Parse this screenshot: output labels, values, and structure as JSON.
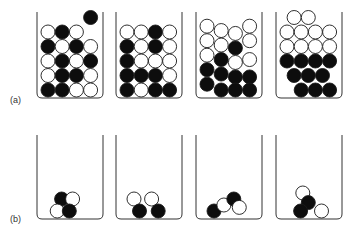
{
  "colors": {
    "stroke": "#1a1a1a",
    "black_ball": "#0d0d0d",
    "white_ball": "#ffffff",
    "beaker": "#333333"
  },
  "panels": [
    {
      "label": "(a)",
      "description": "Beakers filled with black and white balls, progressively separating",
      "beakers": [
        {
          "balls": [
            [
              "w",
              0,
              0
            ],
            [
              "b",
              1,
              0
            ],
            [
              "w",
              2,
              0
            ],
            [
              "b",
              3,
              -1
            ],
            [
              "b",
              0,
              1
            ],
            [
              "w",
              1,
              1
            ],
            [
              "b",
              2,
              1
            ],
            [
              "w",
              3,
              1
            ],
            [
              "w",
              0,
              2
            ],
            [
              "b",
              1,
              2
            ],
            [
              "w",
              2,
              2
            ],
            [
              "b",
              3,
              2
            ],
            [
              "w",
              0,
              3
            ],
            [
              "b",
              1,
              3
            ],
            [
              "b",
              2,
              3
            ],
            [
              "w",
              3,
              3
            ],
            [
              "b",
              0,
              4
            ],
            [
              "b",
              1,
              4
            ],
            [
              "w",
              2,
              4
            ],
            [
              "w",
              3,
              4
            ]
          ]
        },
        {
          "balls": [
            [
              "w",
              0,
              0
            ],
            [
              "w",
              1,
              0
            ],
            [
              "b",
              2,
              0
            ],
            [
              "w",
              3,
              0
            ],
            [
              "b",
              0,
              1
            ],
            [
              "w",
              1,
              1
            ],
            [
              "b",
              2,
              1
            ],
            [
              "w",
              3,
              1
            ],
            [
              "b",
              0,
              2
            ],
            [
              "w",
              1,
              2
            ],
            [
              "w",
              2,
              2
            ],
            [
              "w",
              3,
              2
            ],
            [
              "b",
              0,
              3
            ],
            [
              "b",
              1,
              3
            ],
            [
              "b",
              2,
              3
            ],
            [
              "w",
              3,
              3
            ],
            [
              "b",
              0,
              4
            ],
            [
              "w",
              1,
              4
            ],
            [
              "b",
              2,
              4
            ],
            [
              "b",
              3,
              4
            ]
          ]
        },
        {
          "balls": [
            [
              "w",
              0,
              0
            ],
            [
              "w",
              1,
              0.3
            ],
            [
              "w",
              2,
              0.5
            ],
            [
              "w",
              3,
              0
            ],
            [
              "w",
              0,
              1
            ],
            [
              "w",
              1,
              1.3
            ],
            [
              "b",
              2,
              1.5
            ],
            [
              "w",
              3,
              1
            ],
            [
              "w",
              0,
              2
            ],
            [
              "b",
              1,
              2.3
            ],
            [
              "w",
              2,
              2.5
            ],
            [
              "w",
              3,
              2.3
            ],
            [
              "b",
              0,
              3
            ],
            [
              "b",
              1,
              3.3
            ],
            [
              "b",
              2,
              3.5
            ],
            [
              "b",
              3,
              3.5
            ],
            [
              "b",
              0,
              4
            ],
            [
              "b",
              1,
              4.4
            ],
            [
              "b",
              2,
              4.4
            ],
            [
              "b",
              3,
              4.4
            ]
          ]
        },
        {
          "balls": [
            [
              "w",
              0.5,
              0
            ],
            [
              "w",
              1.5,
              0
            ],
            [
              "w",
              0,
              1
            ],
            [
              "w",
              1,
              1
            ],
            [
              "w",
              2,
              1
            ],
            [
              "w",
              3,
              1
            ],
            [
              "w",
              0,
              2
            ],
            [
              "w",
              1,
              2
            ],
            [
              "w",
              2,
              2
            ],
            [
              "w",
              3,
              2
            ],
            [
              "b",
              0,
              3
            ],
            [
              "b",
              1,
              3
            ],
            [
              "b",
              2,
              3
            ],
            [
              "b",
              3,
              3
            ],
            [
              "b",
              0.5,
              4
            ],
            [
              "b",
              1.5,
              4
            ],
            [
              "b",
              2.5,
              4
            ],
            [
              "b",
              1,
              5
            ],
            [
              "b",
              2,
              5
            ],
            [
              "b",
              3,
              5
            ]
          ]
        }
      ]
    },
    {
      "label": "(b)",
      "description": "Beakers each containing a few black and white balls",
      "beakers": [
        {
          "balls": [
            [
              "b",
              0.6,
              1
            ],
            [
              "w",
              1.6,
              1
            ],
            [
              "w",
              0.2,
              0
            ],
            [
              "b",
              1.3,
              0
            ]
          ]
        },
        {
          "balls": [
            [
              "w",
              0,
              1
            ],
            [
              "w",
              1.6,
              1
            ],
            [
              "b",
              0.5,
              0
            ],
            [
              "b",
              2.2,
              0
            ]
          ]
        },
        {
          "balls": [
            [
              "b",
              0,
              0
            ],
            [
              "w",
              0.9,
              0.5
            ],
            [
              "b",
              1.8,
              1
            ],
            [
              "w",
              2.3,
              0.3
            ]
          ]
        },
        {
          "balls": [
            [
              "w",
              0.8,
              1.5
            ],
            [
              "b",
              1.3,
              0.7
            ],
            [
              "b",
              0.6,
              0
            ],
            [
              "w",
              2.5,
              0
            ]
          ]
        }
      ]
    }
  ]
}
